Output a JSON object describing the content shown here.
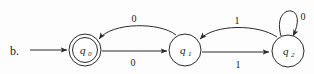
{
  "figure": {
    "part_label": "b.",
    "type": "finite-state-automaton"
  },
  "states": [
    {
      "id": "q0",
      "name": "q",
      "subscript": "0",
      "accepting": true,
      "start": true,
      "cx": 85,
      "cy": 50,
      "r": 16
    },
    {
      "id": "q1",
      "name": "q",
      "subscript": "1",
      "accepting": false,
      "start": false,
      "cx": 185,
      "cy": 50,
      "r": 16
    },
    {
      "id": "q2",
      "name": "q",
      "subscript": "2",
      "accepting": false,
      "start": false,
      "cx": 288,
      "cy": 51,
      "r": 16
    }
  ],
  "transitions": [
    {
      "from": "q0",
      "to": "q1",
      "symbol": "0",
      "shape": "straight-below",
      "label_x": 133,
      "label_y": 66
    },
    {
      "from": "q1",
      "to": "q0",
      "symbol": "0",
      "shape": "arc-above",
      "label_x": 134,
      "label_y": 22
    },
    {
      "from": "q1",
      "to": "q2",
      "symbol": "1",
      "shape": "straight-below",
      "label_x": 238,
      "label_y": 68
    },
    {
      "from": "q2",
      "to": "q1",
      "symbol": "1",
      "shape": "arc-above",
      "label_x": 237,
      "label_y": 24
    },
    {
      "from": "q2",
      "to": "q2",
      "symbol": "0",
      "shape": "self-loop-top",
      "label_x": 303,
      "label_y": 20
    }
  ],
  "start_arrow": {
    "x1": 30,
    "y1": 50,
    "x2": 67,
    "y2": 50
  },
  "colors": {
    "stroke": "#2b2b2b",
    "text": "#1a1a1a",
    "background": "#fdfdfd",
    "state_fill": "#ffffff"
  }
}
